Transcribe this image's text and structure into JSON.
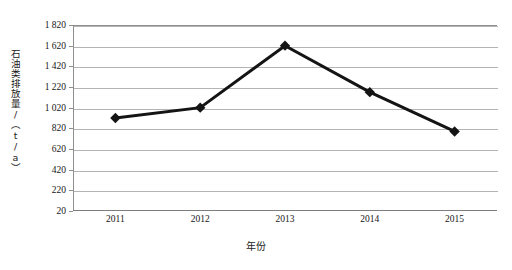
{
  "chart_data": {
    "type": "line",
    "title": "",
    "xlabel": "年份",
    "ylabel": "石油类排放量/（t/a）",
    "categories": [
      "2011",
      "2012",
      "2013",
      "2014",
      "2015"
    ],
    "values": [
      920,
      1020,
      1620,
      1170,
      790
    ],
    "series": [
      {
        "name": "石油类排放量",
        "values": [
          920,
          1020,
          1620,
          1170,
          790
        ]
      }
    ],
    "ylim": [
      20,
      1820
    ],
    "yticks": [
      20,
      220,
      420,
      620,
      820,
      1020,
      1220,
      1420,
      1620,
      1820
    ],
    "ytick_labels": [
      "20",
      "220",
      "420",
      "620",
      "820",
      "1 020",
      "1 220",
      "1 420",
      "1 620",
      "1 820"
    ],
    "xtick_labels": [
      "2011",
      "2012",
      "2013",
      "2014",
      "2015"
    ],
    "grid": true,
    "grid_axis": "y",
    "legend": false,
    "legend_position": "none",
    "marker": "diamond",
    "line_color": "#141414",
    "marker_color": "#141414",
    "grid_color": "#b4b4b4",
    "axis_color": "#8e8e8e",
    "background_color": "#ffffff"
  }
}
